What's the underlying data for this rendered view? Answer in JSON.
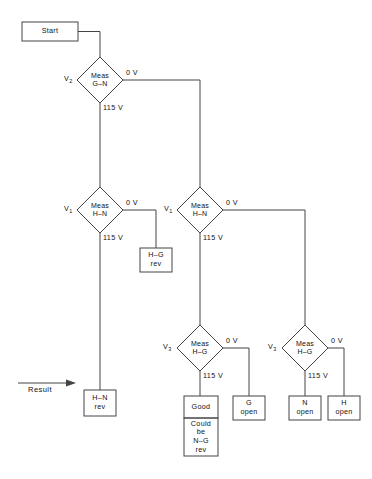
{
  "diagram": {
    "line_color": "#444444",
    "text_color": "#111111",
    "result_label": "Result",
    "start": {
      "label": "Start"
    },
    "decisions": [
      {
        "id": "v2",
        "var": "V",
        "sub": "2",
        "line1": "Meas",
        "line2": "G–N",
        "yes": "0 V",
        "no": "115 V"
      },
      {
        "id": "v1_left",
        "var": "V",
        "sub": "1",
        "line1": "Meas",
        "line2": "H–N",
        "yes": "0 V",
        "no": "115 V"
      },
      {
        "id": "v1_mid",
        "var": "V",
        "sub": "1",
        "line1": "Meas",
        "line2": "H–N",
        "yes": "0 V",
        "no": "115 V"
      },
      {
        "id": "v3_mid",
        "var": "V",
        "sub": "3",
        "line1": "Meas",
        "line2": "H–G",
        "yes": "0 V",
        "no": "115 V"
      },
      {
        "id": "v3_right",
        "var": "V",
        "sub": "3",
        "line1": "Meas",
        "line2": "H–G",
        "yes": "0 V",
        "no": "115 V"
      }
    ],
    "terminals": [
      {
        "id": "hg_rev",
        "line1": "H–G",
        "line2": "rev"
      },
      {
        "id": "hn_rev",
        "line1": "H–N",
        "line2": "rev"
      },
      {
        "id": "good",
        "line1": "Good",
        "line2": ""
      },
      {
        "id": "could_be",
        "line1": "Could",
        "line2": "be",
        "line3": "N–G",
        "line4": "rev"
      },
      {
        "id": "g_open",
        "line1": "G",
        "line2": "open"
      },
      {
        "id": "n_open",
        "line1": "N",
        "line2": "open"
      },
      {
        "id": "h_open",
        "line1": "H",
        "line2": "open"
      }
    ]
  }
}
